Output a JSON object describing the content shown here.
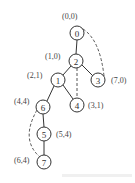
{
  "diagram": {
    "type": "tree",
    "nodes": [
      {
        "id": "0",
        "label": "0",
        "coord": "(0,0)",
        "x": 77,
        "y": 33,
        "coord_x": 62,
        "coord_y": 19
      },
      {
        "id": "2",
        "label": "2",
        "coord": "(1,0)",
        "x": 76,
        "y": 61,
        "coord_x": 45,
        "coord_y": 59
      },
      {
        "id": "3",
        "label": "3",
        "coord": "(7,0)",
        "x": 98,
        "y": 80,
        "coord_x": 111,
        "coord_y": 83
      },
      {
        "id": "1",
        "label": "1",
        "coord": "(2,1)",
        "x": 58,
        "y": 80,
        "coord_x": 27,
        "coord_y": 78
      },
      {
        "id": "4",
        "label": "4",
        "coord": "(3,1)",
        "x": 77,
        "y": 105,
        "coord_x": 88,
        "coord_y": 108
      },
      {
        "id": "6",
        "label": "6",
        "coord": "(4,4)",
        "x": 43,
        "y": 107,
        "coord_x": 14,
        "coord_y": 104
      },
      {
        "id": "5",
        "label": "5",
        "coord": "(5,4)",
        "x": 44,
        "y": 134,
        "coord_x": 56,
        "coord_y": 137
      },
      {
        "id": "7",
        "label": "7",
        "coord": "(6,4)",
        "x": 44,
        "y": 162,
        "coord_x": 14,
        "coord_y": 163
      }
    ],
    "solid_edges": [
      [
        "0",
        "2"
      ],
      [
        "2",
        "1"
      ],
      [
        "2",
        "3"
      ],
      [
        "1",
        "6"
      ],
      [
        "1",
        "4"
      ],
      [
        "6",
        "5"
      ],
      [
        "5",
        "7"
      ]
    ],
    "dashed_edges": [
      {
        "from": "0",
        "to": "3",
        "path": "M83,29 Q100,40 104,76"
      },
      {
        "from": "2",
        "to": "4",
        "path": "M77,68 L77,98"
      },
      {
        "from": "6",
        "to": "7",
        "path": "M37,110 Q20,140 40,157"
      }
    ],
    "colors": {
      "stroke": "#333333",
      "dash": "#555555",
      "background": "#ffffff"
    }
  }
}
